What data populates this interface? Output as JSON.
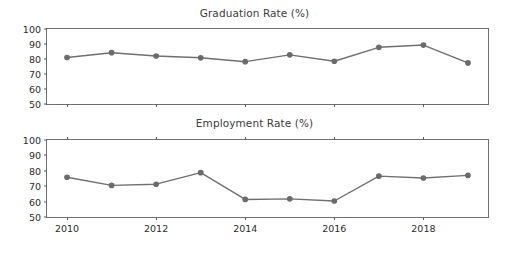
{
  "figure": {
    "background": "#ffffff",
    "line_color": "#6f6f6f",
    "marker_color": "#6b6b6b",
    "axis_color": "#6f6f6f",
    "text_color": "#2b2b2b"
  },
  "chart_data": [
    {
      "type": "line",
      "title": "Graduation Rate (%)",
      "xlabel": "",
      "ylabel": "",
      "x": [
        2010,
        2011,
        2012,
        2013,
        2014,
        2015,
        2016,
        2017,
        2018,
        2019
      ],
      "values": [
        81.0,
        84.2,
        82.0,
        80.8,
        78.2,
        82.8,
        78.5,
        87.8,
        89.3,
        77.4
      ],
      "series": [
        {
          "name": "Graduation Rate",
          "values": [
            81.0,
            84.2,
            82.0,
            80.8,
            78.2,
            82.8,
            78.5,
            87.8,
            89.3,
            77.4
          ]
        }
      ],
      "ylim": [
        50,
        100
      ],
      "yticks": [
        50,
        60,
        70,
        80,
        90,
        100
      ],
      "ytick_labels": [
        "50",
        "60",
        "70",
        "80",
        "90",
        "100"
      ],
      "xlim": [
        2009.55,
        2019.45
      ],
      "xticks": [
        2010,
        2012,
        2014,
        2016,
        2018
      ],
      "xtick_labels": [
        "",
        "",
        "",
        "",
        ""
      ],
      "grid": false,
      "legend": null
    },
    {
      "type": "line",
      "title": "Employment Rate (%)",
      "xlabel": "",
      "ylabel": "",
      "x": [
        2010,
        2011,
        2012,
        2013,
        2014,
        2015,
        2016,
        2017,
        2018,
        2019
      ],
      "values": [
        75.8,
        70.5,
        71.3,
        78.8,
        61.4,
        61.8,
        60.4,
        76.5,
        75.3,
        77.0
      ],
      "series": [
        {
          "name": "Employment Rate",
          "values": [
            75.8,
            70.5,
            71.3,
            78.8,
            61.4,
            61.8,
            60.4,
            76.5,
            75.3,
            77.0
          ]
        }
      ],
      "ylim": [
        50,
        100
      ],
      "yticks": [
        50,
        60,
        70,
        80,
        90,
        100
      ],
      "ytick_labels": [
        "50",
        "60",
        "70",
        "80",
        "90",
        "100"
      ],
      "xlim": [
        2009.55,
        2019.45
      ],
      "xticks": [
        2010,
        2012,
        2014,
        2016,
        2018
      ],
      "xtick_labels": [
        "2010",
        "2012",
        "2014",
        "2016",
        "2018"
      ],
      "grid": false,
      "legend": null
    }
  ]
}
